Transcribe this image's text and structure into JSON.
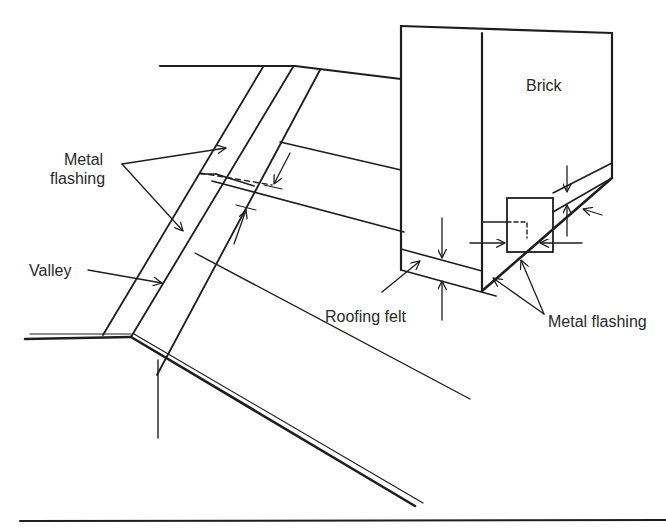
{
  "diagram": {
    "labels": {
      "brick": "Brick",
      "metal_flashing_top_line1": "Metal",
      "metal_flashing_top_line2": "flashing",
      "valley": "Valley",
      "roofing_felt": "Roofing felt",
      "metal_flashing_right": "Metal flashing"
    },
    "colors": {
      "line": "#1e1e1e",
      "background": "#ffffff",
      "text": "#2a2a2a"
    }
  }
}
